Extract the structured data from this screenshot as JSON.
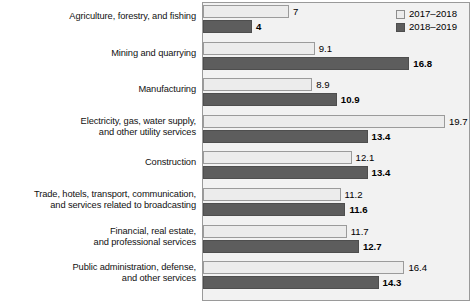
{
  "chart_data": {
    "type": "bar",
    "orientation": "horizontal",
    "title": "",
    "xlabel": "",
    "ylabel": "",
    "grid": false,
    "legend_position": "top-right",
    "xlim": [
      0,
      21.5
    ],
    "categories": [
      "Agriculture, forestry, and fishing",
      "Mining and quarrying",
      "Manufacturing",
      "Electricity, gas, water supply,\nand other utility services",
      "Construction",
      "Trade, hotels, transport, communication,\nand services related to broadcasting",
      "Financial, real estate,\nand professional services",
      "Public administration, defense,\nand other services"
    ],
    "series": [
      {
        "name": "2017–2018",
        "color": "#ececec",
        "values": [
          7,
          9.1,
          8.9,
          19.7,
          12.1,
          11.2,
          11.7,
          16.4
        ],
        "labels": [
          "7",
          "9.1",
          "8.9",
          "19.7",
          "12.1",
          "11.2",
          "11.7",
          "16.4"
        ]
      },
      {
        "name": "2018–2019",
        "color": "#5d5d5d",
        "values": [
          4,
          16.8,
          10.9,
          13.4,
          13.4,
          11.6,
          12.7,
          14.3
        ],
        "labels": [
          "4",
          "16.8",
          "10.9",
          "13.4",
          "13.4",
          "11.6",
          "12.7",
          "14.3"
        ]
      }
    ]
  },
  "legend": {
    "items": [
      {
        "label": "2017–2018",
        "swatch": "light"
      },
      {
        "label": "2018–2019",
        "swatch": "dark"
      }
    ]
  }
}
